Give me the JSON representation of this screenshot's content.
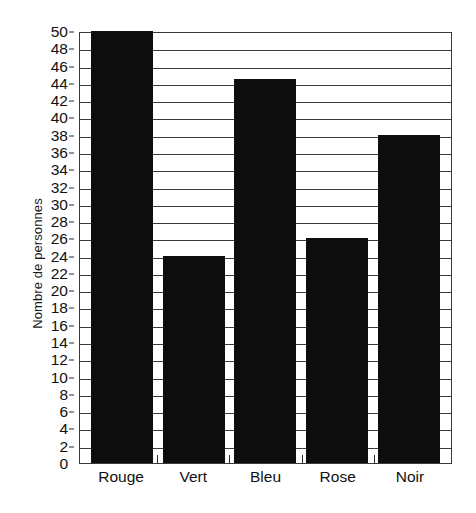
{
  "chart_data": {
    "type": "bar",
    "title": "",
    "subtitle": "",
    "xlabel": "",
    "ylabel": "Nombre de personnes",
    "categories": [
      "Rouge",
      "Vert",
      "Bleu",
      "Rose",
      "Noir"
    ],
    "values": [
      50,
      24,
      44.5,
      26,
      38
    ],
    "series": [
      {
        "name": "Nombre de personnes",
        "values": [
          50,
          24,
          44.5,
          26,
          38
        ]
      }
    ],
    "ylim": [
      0,
      50
    ],
    "xlim": null,
    "ytick_step": 2,
    "yticks": [
      0,
      2,
      4,
      6,
      8,
      10,
      12,
      14,
      16,
      18,
      20,
      22,
      24,
      26,
      28,
      30,
      32,
      34,
      36,
      38,
      40,
      42,
      44,
      46,
      48,
      50
    ],
    "ytick_labels": [
      "0",
      "2",
      "4",
      "6",
      "8",
      "10",
      "12",
      "14",
      "16",
      "18",
      "20",
      "22",
      "24",
      "26",
      "28",
      "30",
      "32",
      "34",
      "36",
      "38",
      "40",
      "42",
      "44",
      "46",
      "48",
      "50"
    ],
    "grid": true,
    "grid_axis": "y",
    "legend": false,
    "legend_position": "none",
    "annotations": [],
    "colors": {
      "bar": "#0d0d0d",
      "grid": "#3a3a3a",
      "axis": "#3a3a3a",
      "text": "#111111",
      "background": "#ffffff"
    }
  }
}
